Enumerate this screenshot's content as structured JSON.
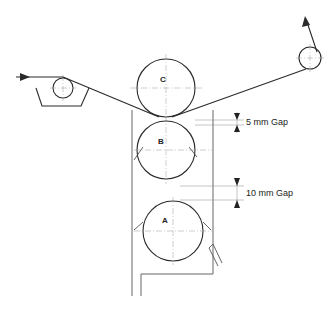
{
  "diagram": {
    "rolls": [
      {
        "id": "C",
        "label": "C"
      },
      {
        "id": "B",
        "label": "B"
      },
      {
        "id": "A",
        "label": "A"
      }
    ],
    "gaps": [
      {
        "label": "5 mm Gap",
        "value_mm": 5,
        "between": [
          "C",
          "B"
        ]
      },
      {
        "label": "10 mm Gap",
        "value_mm": 10,
        "between": [
          "B",
          "A"
        ]
      }
    ],
    "elements": {
      "input_arrow": "web feed direction in",
      "output_arrow": "web feed direction out",
      "left_idler_roll": "idler roll in trough",
      "right_idler_roll": "take-off idler roll",
      "frame": "roll stand frame"
    },
    "colors": {
      "line": "#2a2a2a",
      "centerline": "#9a9a9a",
      "background": "#ffffff"
    }
  }
}
